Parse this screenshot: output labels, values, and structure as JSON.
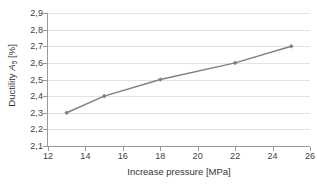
{
  "chart_data": {
    "type": "line",
    "title": "",
    "xlabel": "Increase pressure [MPa]",
    "ylabel": "Ductility A5 [%]",
    "ylabel_prefix": "Ductility ",
    "ylabel_symbol": "A",
    "ylabel_subscript": "5",
    "ylabel_unit": " [%]",
    "x": [
      13,
      15,
      18,
      22,
      25
    ],
    "values": [
      2.3,
      2.4,
      2.5,
      2.6,
      2.7
    ],
    "point_labels": [
      "2,3",
      "2,4",
      "2,5",
      "2,6",
      "2,7"
    ],
    "xlim": [
      12,
      26
    ],
    "ylim": [
      2.1,
      2.9
    ],
    "xticks": [
      12,
      14,
      16,
      18,
      20,
      22,
      24,
      26
    ],
    "xtick_labels": [
      "12",
      "14",
      "16",
      "18",
      "20",
      "22",
      "24",
      "26"
    ],
    "yticks": [
      2.1,
      2.2,
      2.3,
      2.4,
      2.5,
      2.6,
      2.7,
      2.8,
      2.9
    ],
    "ytick_labels": [
      "2,1",
      "2,2",
      "2,3",
      "2,4",
      "2,5",
      "2,6",
      "2,7",
      "2,8",
      "2,9"
    ],
    "grid": "horizontal",
    "legend": "none",
    "series_color": "#808080",
    "gridline_color": "#e3e3e3",
    "axis_color": "#9a9a9a",
    "background_color": "#ffffff",
    "marker": "diamond"
  }
}
